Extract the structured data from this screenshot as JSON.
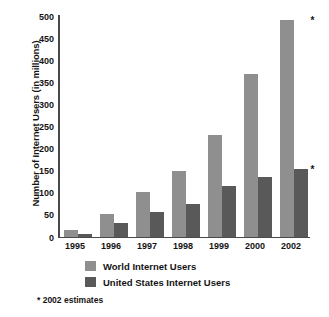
{
  "chart_data": {
    "type": "bar",
    "title": "",
    "xlabel": "",
    "ylabel": "Number of Internet Users (in millions)",
    "categories": [
      "1995",
      "1996",
      "1997",
      "1998",
      "1999",
      "2000",
      "2002"
    ],
    "series": [
      {
        "name": "World Internet Users",
        "color": "#8f8f8f",
        "values": [
          15,
          50,
          100,
          148,
          230,
          368,
          490
        ]
      },
      {
        "name": "United States Internet Users",
        "color": "#595959",
        "values": [
          5,
          30,
          55,
          74,
          115,
          135,
          153
        ]
      }
    ],
    "ylim": [
      0,
      500
    ],
    "ytick_labels": [
      "0",
      "50",
      "100",
      "150",
      "200",
      "250",
      "300",
      "350",
      "400",
      "450",
      "500"
    ],
    "ytick_values": [
      0,
      50,
      100,
      150,
      200,
      250,
      300,
      350,
      400,
      450,
      500
    ],
    "grid": false,
    "legend_position": "bottom",
    "annotations": [
      {
        "text": "*",
        "category": "2002",
        "series": "World Internet Users"
      },
      {
        "text": "*",
        "category": "2002",
        "series": "United States Internet Users"
      }
    ],
    "footnote": "* 2002 estimates"
  },
  "legend": {
    "items": [
      {
        "label": "World Internet Users"
      },
      {
        "label": "United States Internet Users"
      }
    ]
  },
  "footnote": {
    "text": "* 2002 estimates"
  }
}
